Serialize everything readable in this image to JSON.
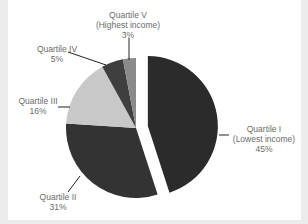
{
  "chart_data": {
    "type": "pie",
    "title": "",
    "categories": [
      "Quartile I (Lowest income)",
      "Quartile II",
      "Quartile III",
      "Quartile IV",
      "Quartile V (Highest income)"
    ],
    "values": [
      45,
      31,
      16,
      5,
      3
    ],
    "unit": "%",
    "colors": [
      "#2b2b2b",
      "#333333",
      "#c8c8c8",
      "#3f3f3f",
      "#8a8a8a"
    ],
    "exploded": [
      "Quartile I (Lowest income)"
    ],
    "legend": "none (leader-line labels)"
  },
  "labels": {
    "q1": {
      "line1": "Quartile I",
      "line2": "(Lowest income)",
      "pct": "45%"
    },
    "q2": {
      "line1": "Quartile II",
      "pct": "31%"
    },
    "q3": {
      "line1": "Quartile III",
      "pct": "16%"
    },
    "q4": {
      "line1": "Quartile IV",
      "pct": "5%"
    },
    "q5": {
      "line1": "Quartile V",
      "line2": "(Highest income)",
      "pct": "3%"
    }
  }
}
